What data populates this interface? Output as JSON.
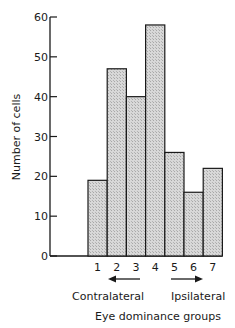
{
  "chart_data": {
    "type": "bar",
    "title": "",
    "xlabel": "Eye dominance groups",
    "ylabel": "Number of cells",
    "categories": [
      "1",
      "2",
      "3",
      "4",
      "5",
      "6",
      "7"
    ],
    "values": [
      19,
      47,
      40,
      58,
      26,
      16,
      22
    ],
    "ylim": [
      0,
      60
    ],
    "yticks": [
      0,
      10,
      20,
      30,
      40,
      50,
      60
    ],
    "ytick_labels": [
      "0",
      "10",
      "20",
      "30",
      "40",
      "50",
      "60"
    ],
    "grid": false,
    "legend": null,
    "bar_fill": "#cfcfcf",
    "bar_edge": "#1a1a1a",
    "annotations": {
      "left_label": "Contralateral",
      "right_label": "Ipsilateral",
      "left_arrow": "arrow-left",
      "right_arrow": "arrow-right"
    }
  }
}
